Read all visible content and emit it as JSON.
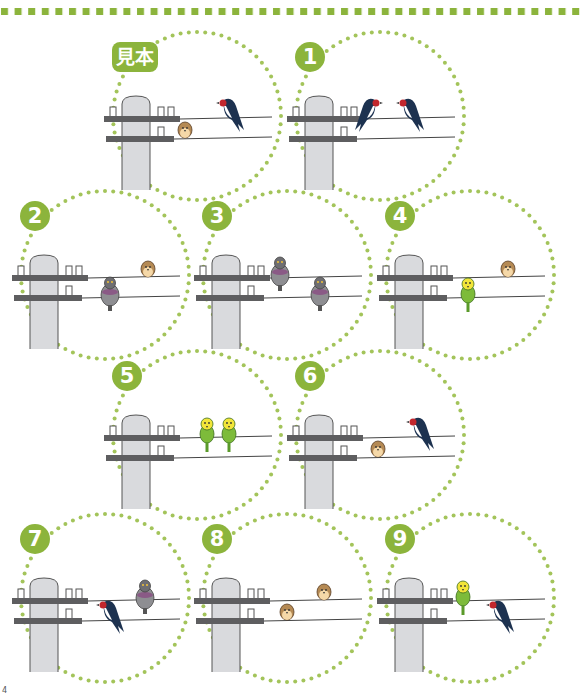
{
  "colors": {
    "accent_green": "#8cb43c",
    "dot_green": "#a3c45a",
    "pole_fill": "#d9dadd",
    "pole_stroke": "#555555",
    "crossarm": "#5e5e60",
    "wire": "#444444"
  },
  "panels": [
    {
      "id": "sample",
      "label": "見本",
      "x": 100,
      "y": 30,
      "birds": [
        {
          "type": "swallow",
          "wire": "top",
          "pos": 128,
          "facing": "left"
        },
        {
          "type": "sparrow",
          "wire": "bottom",
          "pos": 85
        }
      ]
    },
    {
      "id": "1",
      "label": "1",
      "x": 283,
      "y": 30,
      "birds": [
        {
          "type": "swallow",
          "wire": "top",
          "pos": 88,
          "facing": "right"
        },
        {
          "type": "swallow",
          "wire": "top",
          "pos": 125,
          "facing": "left"
        }
      ]
    },
    {
      "id": "2",
      "label": "2",
      "x": 8,
      "y": 189,
      "birds": [
        {
          "type": "pigeon",
          "wire": "bottom",
          "pos": 102
        },
        {
          "type": "sparrow",
          "wire": "top",
          "pos": 140
        }
      ]
    },
    {
      "id": "3",
      "label": "3",
      "x": 190,
      "y": 189,
      "birds": [
        {
          "type": "pigeon",
          "wire": "top",
          "pos": 90
        },
        {
          "type": "pigeon",
          "wire": "bottom",
          "pos": 130
        }
      ]
    },
    {
      "id": "4",
      "label": "4",
      "x": 373,
      "y": 189,
      "birds": [
        {
          "type": "parakeet",
          "wire": "bottom",
          "pos": 95
        },
        {
          "type": "sparrow",
          "wire": "top",
          "pos": 135
        }
      ]
    },
    {
      "id": "5",
      "label": "5",
      "x": 100,
      "y": 349,
      "birds": [
        {
          "type": "parakeet",
          "wire": "top",
          "pos": 107
        },
        {
          "type": "parakeet",
          "wire": "top",
          "pos": 129
        }
      ]
    },
    {
      "id": "6",
      "label": "6",
      "x": 283,
      "y": 349,
      "birds": [
        {
          "type": "swallow",
          "wire": "top",
          "pos": 135,
          "facing": "left"
        },
        {
          "type": "sparrow",
          "wire": "bottom",
          "pos": 95
        }
      ]
    },
    {
      "id": "7",
      "label": "7",
      "x": 8,
      "y": 512,
      "birds": [
        {
          "type": "swallow",
          "wire": "bottom",
          "pos": 100,
          "facing": "left"
        },
        {
          "type": "pigeon",
          "wire": "top",
          "pos": 137
        }
      ]
    },
    {
      "id": "8",
      "label": "8",
      "x": 190,
      "y": 512,
      "birds": [
        {
          "type": "sparrow",
          "wire": "top",
          "pos": 134
        },
        {
          "type": "sparrow",
          "wire": "bottom",
          "pos": 97
        }
      ]
    },
    {
      "id": "9",
      "label": "9",
      "x": 373,
      "y": 512,
      "birds": [
        {
          "type": "parakeet",
          "wire": "top",
          "pos": 90
        },
        {
          "type": "swallow",
          "wire": "bottom",
          "pos": 125,
          "facing": "left"
        }
      ]
    }
  ],
  "corner_mark": "4"
}
